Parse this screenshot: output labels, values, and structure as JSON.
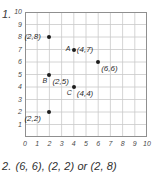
{
  "worksheet": {
    "question1": {
      "number": "1."
    },
    "answer": {
      "number": "2.",
      "text": "(6, 6), (2, 2) or (2, 8)"
    }
  },
  "chart_data": {
    "type": "scatter",
    "title": "",
    "xlabel": "",
    "ylabel": "",
    "xlim": [
      0,
      10
    ],
    "ylim": [
      0,
      10
    ],
    "grid": true,
    "legend": "none",
    "xticks": [
      "0",
      "1",
      "2",
      "3",
      "4",
      "5",
      "6",
      "7",
      "8",
      "9",
      "10"
    ],
    "yticks": [
      "1",
      "2",
      "3",
      "4",
      "5",
      "6",
      "7",
      "8",
      "9",
      "10"
    ],
    "points": [
      {
        "x": 2,
        "y": 8,
        "letter": "",
        "label": "(2,8)",
        "label_pos": "left",
        "letter_pos": "none"
      },
      {
        "x": 4,
        "y": 7,
        "letter": "A",
        "label": "(4,7)",
        "label_pos": "right",
        "letter_pos": "left"
      },
      {
        "x": 6,
        "y": 6,
        "letter": "",
        "label": "(6,6)",
        "label_pos": "below-right",
        "letter_pos": "none"
      },
      {
        "x": 2,
        "y": 5,
        "letter": "B",
        "label": "(2,5)",
        "label_pos": "below-right",
        "letter_pos": "below-left"
      },
      {
        "x": 4,
        "y": 4,
        "letter": "C",
        "label": "(4,4)",
        "label_pos": "below-right",
        "letter_pos": "below-left"
      },
      {
        "x": 2,
        "y": 2,
        "letter": "",
        "label": "(2,2)",
        "label_pos": "below-left",
        "letter_pos": "none"
      }
    ]
  },
  "colors": {
    "grid_line": "#c9c9c9",
    "frame_line": "#8f8f8f",
    "point": "#1d1d1d",
    "text": "#2b2b2b"
  }
}
